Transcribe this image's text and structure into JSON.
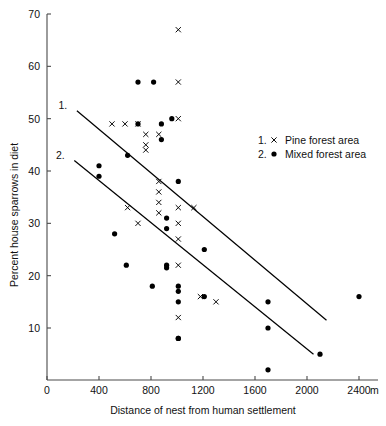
{
  "chart_data": {
    "type": "scatter",
    "title": "",
    "xlabel": "Distance of nest from human settlement",
    "ylabel": "Percent house sparrows in diet",
    "x_unit": "m",
    "xlim": [
      0,
      2500
    ],
    "ylim": [
      0,
      72
    ],
    "xticks": [
      0,
      400,
      800,
      1200,
      1600,
      2000,
      2400
    ],
    "xticklabels": [
      "0",
      "400",
      "800",
      "1200",
      "1600",
      "2000",
      "2400"
    ],
    "yticks": [
      10,
      20,
      30,
      40,
      50,
      60,
      70
    ],
    "yticklabels": [
      "10",
      "20",
      "30",
      "40",
      "50",
      "60",
      "70"
    ],
    "grid": false,
    "legend_position": "right",
    "series": [
      {
        "name": "Pine forest area",
        "key": "1",
        "marker": "x",
        "color": "#000000",
        "points": [
          [
            500,
            49
          ],
          [
            600,
            49
          ],
          [
            700,
            49
          ],
          [
            760,
            47
          ],
          [
            860,
            47
          ],
          [
            760,
            45
          ],
          [
            760,
            44
          ],
          [
            1010,
            67
          ],
          [
            1010,
            57
          ],
          [
            1010,
            50
          ],
          [
            1010,
            33
          ],
          [
            1010,
            30
          ],
          [
            1010,
            27
          ],
          [
            1010,
            22
          ],
          [
            1010,
            12
          ],
          [
            620,
            33
          ],
          [
            860,
            38
          ],
          [
            860,
            36
          ],
          [
            860,
            34
          ],
          [
            860,
            32
          ],
          [
            700,
            30
          ],
          [
            1130,
            33
          ],
          [
            1180,
            16
          ],
          [
            1300,
            15
          ]
        ]
      },
      {
        "name": "Mixed forest area",
        "key": "2",
        "marker": "dot",
        "color": "#000000",
        "points": [
          [
            700,
            57
          ],
          [
            820,
            57
          ],
          [
            400,
            41
          ],
          [
            400,
            39
          ],
          [
            520,
            28
          ],
          [
            610,
            22
          ],
          [
            620,
            43
          ],
          [
            700,
            49
          ],
          [
            880,
            49
          ],
          [
            880,
            46
          ],
          [
            960,
            50
          ],
          [
            810,
            18
          ],
          [
            920,
            31
          ],
          [
            920,
            29
          ],
          [
            920,
            22
          ],
          [
            920,
            21.5
          ],
          [
            1010,
            18
          ],
          [
            1010,
            17
          ],
          [
            1010,
            15
          ],
          [
            1010,
            8
          ],
          [
            1010,
            8
          ],
          [
            1010,
            38
          ],
          [
            1210,
            25
          ],
          [
            1210,
            16
          ],
          [
            1700,
            15
          ],
          [
            1700,
            10
          ],
          [
            1700,
            2
          ],
          [
            2100,
            5
          ],
          [
            2400,
            16
          ]
        ]
      }
    ],
    "fit_lines": [
      {
        "label": "1.",
        "series": "Pine forest area",
        "x0": 230,
        "y0": 51.5,
        "x1": 2150,
        "y1": 11.5
      },
      {
        "label": "2.",
        "series": "Mixed forest area",
        "x0": 210,
        "y0": 42.0,
        "x1": 2050,
        "y1": 5.0
      }
    ]
  },
  "legend": {
    "entries": [
      {
        "index": "1.",
        "marker": "x",
        "label": "Pine forest area"
      },
      {
        "index": "2.",
        "marker": "dot",
        "label": "Mixed forest area"
      }
    ]
  },
  "axis": {
    "x_title": "Distance of nest from human settlement",
    "y_title": "Percent house sparrows in diet",
    "x_unit_suffix": "m"
  }
}
